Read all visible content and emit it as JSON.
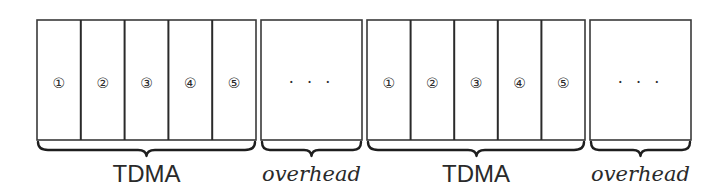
{
  "diagram": {
    "colors": {
      "stroke": "#2a2a2a",
      "background": "#ffffff"
    },
    "groups": [
      {
        "type": "tdma",
        "label": "TDMA",
        "slots": [
          {
            "label": "①"
          },
          {
            "label": "②"
          },
          {
            "label": "③"
          },
          {
            "label": "④"
          },
          {
            "label": "⑤"
          }
        ]
      },
      {
        "type": "overhead",
        "label": "overhead",
        "content": "· · ·"
      },
      {
        "type": "tdma",
        "label": "TDMA",
        "slots": [
          {
            "label": "①"
          },
          {
            "label": "②"
          },
          {
            "label": "③"
          },
          {
            "label": "④"
          },
          {
            "label": "⑤"
          }
        ]
      },
      {
        "type": "overhead",
        "label": "overhead",
        "content": "· · ·"
      }
    ]
  }
}
